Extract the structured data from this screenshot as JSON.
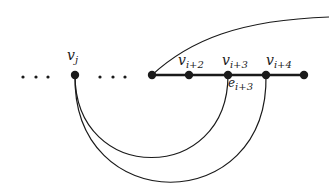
{
  "diagram": {
    "type": "graph",
    "stroke_color": "#1a1a1a",
    "background": "#ffffff",
    "ellipsis_left": "...",
    "ellipsis_middle": "...",
    "nodes": [
      {
        "id": "vj",
        "label_main": "v",
        "label_sub": "j",
        "x": 75,
        "y": 75
      },
      {
        "id": "vi+1",
        "label_main": "",
        "label_sub": "",
        "x": 152,
        "y": 75
      },
      {
        "id": "vi+2",
        "label_main": "v",
        "label_sub": "i+2",
        "x": 189,
        "y": 75
      },
      {
        "id": "vi+3",
        "label_main": "v",
        "label_sub": "i+3",
        "x": 228,
        "y": 75
      },
      {
        "id": "vi+4",
        "label_main": "v",
        "label_sub": "i+4",
        "x": 266,
        "y": 75
      },
      {
        "id": "vi+5",
        "label_main": "",
        "label_sub": "",
        "x": 304,
        "y": 75
      }
    ],
    "edges": [
      {
        "from": "vi+1",
        "to": "vi+5",
        "kind": "path",
        "weight": "thick"
      },
      {
        "from": "vj",
        "to": "vi+3",
        "kind": "arc-below"
      },
      {
        "from": "vj",
        "to": "vi+4",
        "kind": "arc-below"
      },
      {
        "from": "vi+1",
        "to": "offscreen-right",
        "kind": "curve-up"
      }
    ],
    "edge_label": {
      "main": "e",
      "sub": "i+3"
    }
  }
}
